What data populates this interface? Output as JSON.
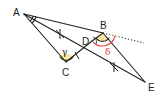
{
  "points": {
    "A": {
      "label": "A"
    },
    "B": {
      "label": "B"
    },
    "C": {
      "label": "C"
    },
    "D": {
      "label": "D"
    },
    "E": {
      "label": "E"
    }
  },
  "angles": {
    "gamma": {
      "label": "γ",
      "vertex": "C",
      "fill": "#f7e08a"
    },
    "delta": {
      "label": "δ",
      "vertex": "B",
      "color": "#e0463a"
    },
    "at_A": {
      "vertex": "A",
      "double_arc": true
    },
    "at_B_inner": {
      "vertex": "B",
      "fill": "#f7e08a"
    }
  },
  "segments": [
    "AB",
    "AC",
    "AE",
    "CD",
    "DB",
    "BE"
  ],
  "extension": {
    "from": "B",
    "style": "dotted",
    "description": "ray AB extended past B"
  },
  "equal_marks": [
    {
      "segment": "AE",
      "count": 2,
      "mark": "×"
    },
    {
      "segment": "CD",
      "count": 1,
      "mark": "|"
    }
  ],
  "colors": {
    "line": "#222222",
    "delta_arc": "#e0463a",
    "angle_fill": "#f7e08a"
  }
}
